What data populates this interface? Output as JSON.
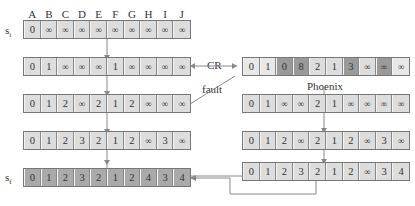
{
  "columns": [
    "A",
    "B",
    "C",
    "D",
    "E",
    "F",
    "G",
    "H",
    "I",
    "J"
  ],
  "labels": {
    "si": "s",
    "si_sub": "i",
    "sf": "s",
    "sf_sub": "f",
    "cr": "CR",
    "fault": "fault",
    "phoenix": "Phoenix"
  },
  "left_rows": [
    [
      "0",
      "∞",
      "∞",
      "∞",
      "∞",
      "∞",
      "∞",
      "∞",
      "∞",
      "∞"
    ],
    [
      "0",
      "1",
      "∞",
      "∞",
      "∞",
      "1",
      "∞",
      "∞",
      "∞",
      "∞"
    ],
    [
      "0",
      "1",
      "2",
      "∞",
      "2",
      "1",
      "2",
      "∞",
      "∞",
      "∞"
    ],
    [
      "0",
      "1",
      "2",
      "3",
      "2",
      "1",
      "2",
      "∞",
      "3",
      "∞"
    ],
    [
      "0",
      "1",
      "2",
      "3",
      "2",
      "1",
      "2",
      "4",
      "3",
      "4"
    ]
  ],
  "right_rows": [
    [
      "0",
      "1",
      "0",
      "8",
      "2",
      "1",
      "3",
      "∞",
      "∞",
      "∞"
    ],
    [
      "0",
      "1",
      "∞",
      "∞",
      "2",
      "1",
      "∞",
      "∞",
      "∞",
      "∞"
    ],
    [
      "0",
      "1",
      "2",
      "∞",
      "2",
      "1",
      "2",
      "∞",
      "3",
      "∞"
    ],
    [
      "0",
      "1",
      "2",
      "3",
      "2",
      "1",
      "2",
      "∞",
      "3",
      "4"
    ]
  ],
  "cr_row_shading": [
    "light",
    "light",
    "dark",
    "dark",
    "normal",
    "normal",
    "dark",
    "normal",
    "dark",
    "light"
  ],
  "colors": {
    "cell": "#dddddd",
    "dark_cell": "#9a9a9a",
    "final_cell": "#aaaaaa",
    "line": "#888888"
  }
}
